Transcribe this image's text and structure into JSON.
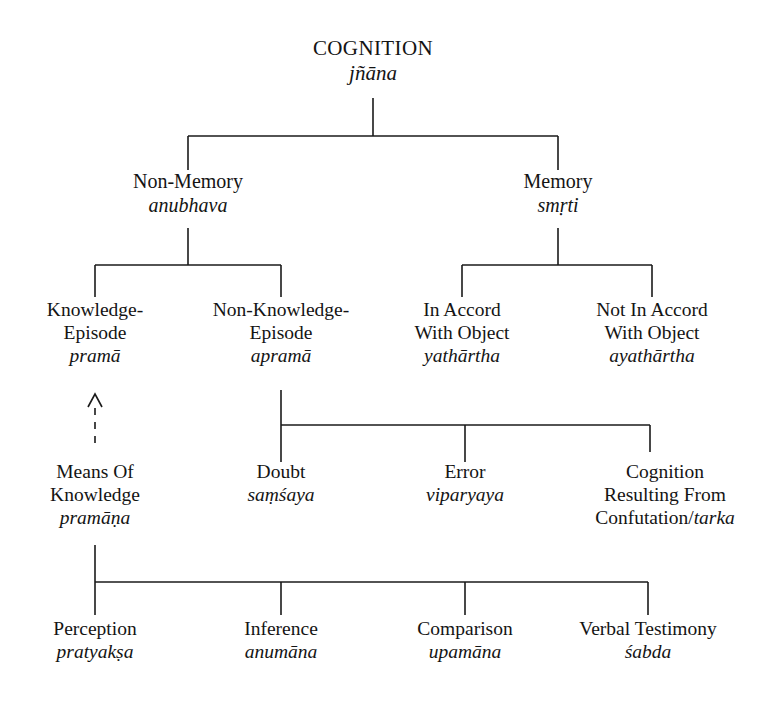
{
  "diagram": {
    "type": "tree",
    "background_color": "#ffffff",
    "line_color": "#1a1a1a",
    "text_color": "#141414"
  },
  "nodes": {
    "cognition": {
      "english": "COGNITION",
      "sanskrit": "jñāna"
    },
    "non_memory": {
      "english": "Non-Memory",
      "sanskrit": "anubhava"
    },
    "memory": {
      "english": "Memory",
      "sanskrit": "smṛti"
    },
    "knowledge_ep": {
      "english_line1": "Knowledge-",
      "english_line2": "Episode",
      "sanskrit": "pramā"
    },
    "non_knowledge_ep": {
      "english_line1": "Non-Knowledge-",
      "english_line2": "Episode",
      "sanskrit": "apramā"
    },
    "in_accord": {
      "english_line1": "In Accord",
      "english_line2": "With Object",
      "sanskrit": "yathārtha"
    },
    "not_in_accord": {
      "english_line1": "Not In Accord",
      "english_line2": "With Object",
      "sanskrit": "ayathārtha"
    },
    "means_of_knowledge": {
      "english_line1": "Means Of",
      "english_line2": "Knowledge",
      "sanskrit": "pramāṇa"
    },
    "doubt": {
      "english": "Doubt",
      "sanskrit": "saṃśaya"
    },
    "error": {
      "english": "Error",
      "sanskrit": "viparyaya"
    },
    "confutation": {
      "english_line1": "Cognition",
      "english_line2": "Resulting From",
      "english_line3": "Confutation/",
      "sanskrit": "tarka"
    },
    "perception": {
      "english": "Perception",
      "sanskrit": "pratyakṣa"
    },
    "inference": {
      "english": "Inference",
      "sanskrit": "anumāna"
    },
    "comparison": {
      "english": "Comparison",
      "sanskrit": "upamāna"
    },
    "verbal_testimony": {
      "english": "Verbal Testimony",
      "sanskrit": "śabda"
    }
  },
  "edges": [
    {
      "from": "cognition",
      "to": "non_memory",
      "style": "solid"
    },
    {
      "from": "cognition",
      "to": "memory",
      "style": "solid"
    },
    {
      "from": "non_memory",
      "to": "knowledge_ep",
      "style": "solid"
    },
    {
      "from": "non_memory",
      "to": "non_knowledge_ep",
      "style": "solid"
    },
    {
      "from": "memory",
      "to": "in_accord",
      "style": "solid"
    },
    {
      "from": "memory",
      "to": "not_in_accord",
      "style": "solid"
    },
    {
      "from": "means_of_knowledge",
      "to": "knowledge_ep",
      "style": "dashed-arrow"
    },
    {
      "from": "non_knowledge_ep",
      "to": "doubt",
      "style": "solid"
    },
    {
      "from": "non_knowledge_ep",
      "to": "error",
      "style": "solid"
    },
    {
      "from": "non_knowledge_ep",
      "to": "confutation",
      "style": "solid"
    },
    {
      "from": "means_of_knowledge",
      "to": "perception",
      "style": "solid"
    },
    {
      "from": "means_of_knowledge",
      "to": "inference",
      "style": "solid"
    },
    {
      "from": "means_of_knowledge",
      "to": "comparison",
      "style": "solid"
    },
    {
      "from": "means_of_knowledge",
      "to": "verbal_testimony",
      "style": "solid"
    }
  ]
}
